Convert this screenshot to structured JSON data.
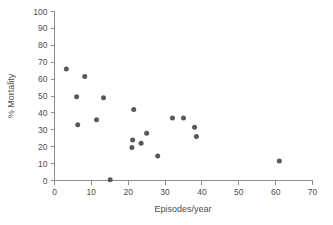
{
  "chart_data": {
    "type": "scatter",
    "title": "",
    "xlabel": "Episodes/year",
    "ylabel": "% Mortality",
    "xlim": [
      0,
      70
    ],
    "ylim": [
      0,
      100
    ],
    "xticks": [
      0,
      10,
      20,
      30,
      40,
      50,
      60,
      70
    ],
    "yticks": [
      0,
      10,
      20,
      30,
      40,
      50,
      60,
      70,
      80,
      90,
      100
    ],
    "xtick_labels": [
      "0",
      "10",
      "20",
      "30",
      "40",
      "50",
      "60",
      "70"
    ],
    "ytick_labels": [
      "0",
      "10",
      "20",
      "30",
      "40",
      "50",
      "60",
      "70",
      "80",
      "90",
      "100"
    ],
    "grid": false,
    "legend": false,
    "marker": "circle",
    "marker_color": "#595959",
    "marker_size": 5,
    "points": [
      {
        "x": 3.2,
        "y": 66.0
      },
      {
        "x": 6.0,
        "y": 49.5
      },
      {
        "x": 6.3,
        "y": 33.0
      },
      {
        "x": 8.2,
        "y": 61.5
      },
      {
        "x": 11.4,
        "y": 36.0
      },
      {
        "x": 13.3,
        "y": 49.0
      },
      {
        "x": 15.1,
        "y": 0.5
      },
      {
        "x": 21.0,
        "y": 19.5
      },
      {
        "x": 21.2,
        "y": 24.0
      },
      {
        "x": 21.5,
        "y": 42.0
      },
      {
        "x": 23.5,
        "y": 22.0
      },
      {
        "x": 25.0,
        "y": 28.0
      },
      {
        "x": 28.0,
        "y": 14.5
      },
      {
        "x": 32.0,
        "y": 37.0
      },
      {
        "x": 35.0,
        "y": 37.0
      },
      {
        "x": 38.0,
        "y": 31.5
      },
      {
        "x": 38.5,
        "y": 26.0
      },
      {
        "x": 61.0,
        "y": 11.5
      }
    ],
    "n_points": 18,
    "axis_color": "#8c8c8c",
    "text_color": "#4d4d4d"
  }
}
